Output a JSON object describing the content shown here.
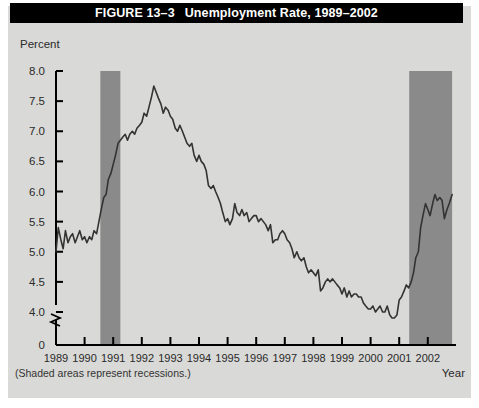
{
  "figure": {
    "number_label": "FIGURE 13–3",
    "title": "Unemployment Rate, 1989–2002",
    "note": "(Shaded areas represent recessions.)",
    "background_color": "#d9d9d7",
    "banner_color": "#000000",
    "banner_text_color": "#ffffff",
    "shade_color": "#8a8a8a",
    "line_color": "#333333",
    "axis_color": "#000000"
  },
  "chart_data": {
    "type": "line",
    "title": "Unemployment Rate, 1989–2002",
    "xlabel": "Year",
    "ylabel": "Percent",
    "xlim": [
      1989,
      2002.9
    ],
    "ylim": [
      3.7,
      8.0
    ],
    "grid": false,
    "legend": null,
    "axis_break": true,
    "ytick_labels": [
      "8.0",
      "7.5",
      "7.0",
      "6.5",
      "6.0",
      "5.5",
      "5.0",
      "4.5",
      "4.0",
      "0"
    ],
    "ytick_values": [
      8.0,
      7.5,
      7.0,
      6.5,
      6.0,
      5.5,
      5.0,
      4.5,
      4.0,
      0
    ],
    "xtick_labels": [
      "1989",
      "1990",
      "1991",
      "1992",
      "1993",
      "1994",
      "1995",
      "1996",
      "1997",
      "1998",
      "1999",
      "2000",
      "2001",
      "2002"
    ],
    "xtick_values": [
      1989,
      1990,
      1991,
      1992,
      1993,
      1994,
      1995,
      1996,
      1997,
      1998,
      1999,
      2000,
      2001,
      2002
    ],
    "shaded_regions": [
      {
        "label": "recession-1990-1991",
        "start": 1990.55,
        "end": 1991.25
      },
      {
        "label": "recession-2001-2002",
        "start": 2001.35,
        "end": 2002.85
      }
    ],
    "series": [
      {
        "name": "Unemployment Rate",
        "x": [
          1989.0,
          1989.08,
          1989.17,
          1989.25,
          1989.33,
          1989.42,
          1989.5,
          1989.58,
          1989.67,
          1989.75,
          1989.83,
          1989.92,
          1990.0,
          1990.08,
          1990.17,
          1990.25,
          1990.33,
          1990.42,
          1990.5,
          1990.58,
          1990.67,
          1990.75,
          1990.83,
          1990.92,
          1991.0,
          1991.08,
          1991.17,
          1991.25,
          1991.33,
          1991.42,
          1991.5,
          1991.58,
          1991.67,
          1991.75,
          1991.83,
          1991.92,
          1992.0,
          1992.08,
          1992.17,
          1992.25,
          1992.33,
          1992.42,
          1992.5,
          1992.58,
          1992.67,
          1992.75,
          1992.83,
          1992.92,
          1993.0,
          1993.08,
          1993.17,
          1993.25,
          1993.33,
          1993.42,
          1993.5,
          1993.58,
          1993.67,
          1993.75,
          1993.83,
          1993.92,
          1994.0,
          1994.08,
          1994.17,
          1994.25,
          1994.33,
          1994.42,
          1994.5,
          1994.58,
          1994.67,
          1994.75,
          1994.83,
          1994.92,
          1995.0,
          1995.08,
          1995.17,
          1995.25,
          1995.33,
          1995.42,
          1995.5,
          1995.58,
          1995.67,
          1995.75,
          1995.83,
          1995.92,
          1996.0,
          1996.08,
          1996.17,
          1996.25,
          1996.33,
          1996.42,
          1996.5,
          1996.58,
          1996.67,
          1996.75,
          1996.83,
          1996.92,
          1997.0,
          1997.08,
          1997.17,
          1997.25,
          1997.33,
          1997.42,
          1997.5,
          1997.58,
          1997.67,
          1997.75,
          1997.83,
          1997.92,
          1998.0,
          1998.08,
          1998.17,
          1998.25,
          1998.33,
          1998.42,
          1998.5,
          1998.58,
          1998.67,
          1998.75,
          1998.83,
          1998.92,
          1999.0,
          1999.08,
          1999.17,
          1999.25,
          1999.33,
          1999.42,
          1999.5,
          1999.58,
          1999.67,
          1999.75,
          1999.83,
          1999.92,
          2000.0,
          2000.08,
          2000.17,
          2000.25,
          2000.33,
          2000.42,
          2000.5,
          2000.58,
          2000.67,
          2000.75,
          2000.83,
          2000.92,
          2001.0,
          2001.08,
          2001.17,
          2001.25,
          2001.33,
          2001.42,
          2001.5,
          2001.58,
          2001.67,
          2001.75,
          2001.83,
          2001.92,
          2002.0,
          2002.08,
          2002.17,
          2002.25,
          2002.33,
          2002.42,
          2002.5,
          2002.58,
          2002.67,
          2002.75,
          2002.85
        ],
        "y": [
          5.0,
          5.4,
          5.2,
          5.05,
          5.35,
          5.15,
          5.25,
          5.3,
          5.15,
          5.25,
          5.35,
          5.2,
          5.25,
          5.15,
          5.25,
          5.2,
          5.35,
          5.3,
          5.5,
          5.7,
          5.9,
          5.95,
          6.2,
          6.3,
          6.45,
          6.6,
          6.8,
          6.85,
          6.9,
          6.95,
          6.85,
          6.95,
          7.0,
          6.95,
          7.05,
          7.1,
          7.15,
          7.3,
          7.25,
          7.4,
          7.55,
          7.75,
          7.65,
          7.55,
          7.45,
          7.3,
          7.4,
          7.35,
          7.25,
          7.2,
          7.05,
          7.0,
          7.1,
          7.0,
          6.9,
          6.8,
          6.75,
          6.8,
          6.6,
          6.5,
          6.6,
          6.5,
          6.45,
          6.35,
          6.1,
          6.05,
          6.1,
          6.0,
          5.9,
          5.8,
          5.65,
          5.5,
          5.55,
          5.45,
          5.55,
          5.8,
          5.65,
          5.6,
          5.7,
          5.6,
          5.65,
          5.5,
          5.55,
          5.6,
          5.6,
          5.5,
          5.55,
          5.5,
          5.45,
          5.35,
          5.45,
          5.15,
          5.2,
          5.2,
          5.3,
          5.35,
          5.3,
          5.2,
          5.15,
          5.05,
          4.9,
          5.0,
          4.9,
          4.85,
          4.9,
          4.75,
          4.65,
          4.7,
          4.65,
          4.6,
          4.7,
          4.35,
          4.4,
          4.5,
          4.55,
          4.5,
          4.55,
          4.5,
          4.45,
          4.4,
          4.3,
          4.4,
          4.25,
          4.35,
          4.25,
          4.3,
          4.3,
          4.25,
          4.25,
          4.15,
          4.1,
          4.05,
          4.05,
          4.1,
          4.0,
          4.05,
          4.1,
          4.0,
          4.0,
          4.1,
          3.95,
          3.9,
          3.9,
          3.95,
          4.2,
          4.25,
          4.35,
          4.45,
          4.4,
          4.5,
          4.65,
          4.9,
          5.0,
          5.4,
          5.6,
          5.8,
          5.7,
          5.6,
          5.8,
          5.95,
          5.85,
          5.9,
          5.85,
          5.55,
          5.7,
          5.8,
          5.95
        ]
      }
    ]
  }
}
